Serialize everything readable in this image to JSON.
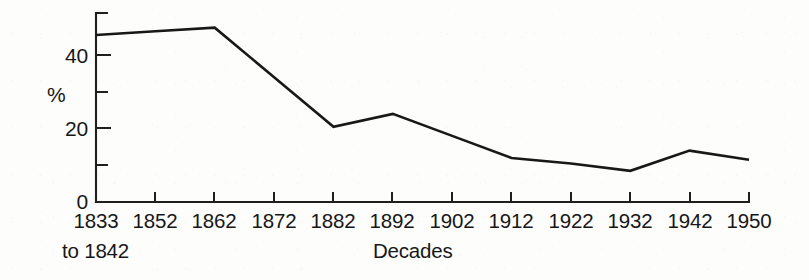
{
  "chart_data": {
    "type": "line",
    "title": "",
    "xlabel": "Decades",
    "ylabel": "%",
    "ylim": [
      0,
      52
    ],
    "yticks": [
      0,
      20,
      40
    ],
    "yticks_minor": [
      10,
      30
    ],
    "ytick_labels": [
      "0",
      "20",
      "40"
    ],
    "grid": false,
    "legend": "none",
    "categories": [
      "1833 to 1842",
      "1852",
      "1862",
      "1872",
      "1882",
      "1892",
      "1902",
      "1912",
      "1922",
      "1932",
      "1942",
      "1950"
    ],
    "xtick_labels": [
      "1833",
      "1852",
      "1862",
      "1872",
      "1882",
      "1892",
      "1902",
      "1912",
      "1922",
      "1932",
      "1942",
      "1950"
    ],
    "xtick_continuation": "to 1842",
    "values": [
      45.5,
      46.5,
      47.5,
      34,
      20.5,
      24,
      18,
      12,
      10.5,
      8.5,
      14,
      11.5
    ],
    "points": [
      {
        "x": "1833 to 1842",
        "y": 45.5
      },
      {
        "x": "1852",
        "y": 46.5
      },
      {
        "x": "1862",
        "y": 47.5
      },
      {
        "x": "1872",
        "y": 34
      },
      {
        "x": "1882",
        "y": 20.5
      },
      {
        "x": "1892",
        "y": 24
      },
      {
        "x": "1902",
        "y": 18
      },
      {
        "x": "1912",
        "y": 12
      },
      {
        "x": "1922",
        "y": 10.5
      },
      {
        "x": "1932",
        "y": 8.5
      },
      {
        "x": "1942",
        "y": 14
      },
      {
        "x": "1950",
        "y": 11.5
      }
    ],
    "vertices": [
      {
        "x": "1833 to 1842",
        "y": 45.5
      },
      {
        "x": "1862",
        "y": 47.5
      },
      {
        "x": "1882",
        "y": 20.5
      },
      {
        "x": "1892",
        "y": 24
      },
      {
        "x": "1912",
        "y": 12
      },
      {
        "x": "1932",
        "y": 8.5
      },
      {
        "x": "1942",
        "y": 14
      },
      {
        "x": "1950",
        "y": 11.5
      }
    ],
    "colors": {
      "line": "#181818",
      "axis": "#1f1f1f",
      "background": "#fdfdfc"
    }
  }
}
